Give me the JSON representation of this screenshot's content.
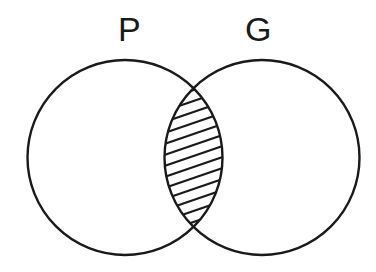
{
  "diagram": {
    "type": "venn",
    "sets": [
      {
        "id": "P",
        "label": "P",
        "cx": 125,
        "cy": 157.5,
        "r": 97.5
      },
      {
        "id": "G",
        "label": "G",
        "cx": 262,
        "cy": 157.5,
        "r": 97.5
      }
    ],
    "shaded_region": "P ∩ G",
    "shading_style": "diagonal-hatch",
    "colors": {
      "stroke": "#1a1a1a",
      "background": "#ffffff",
      "hatch": "#1a1a1a"
    }
  }
}
